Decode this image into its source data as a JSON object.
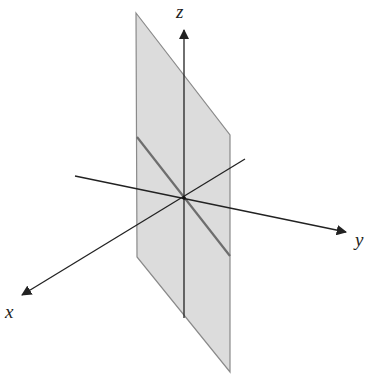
{
  "diagram": {
    "type": "3d-coordinate-axes-with-plane",
    "axes": {
      "x": {
        "label": "x",
        "from": [
          245,
          159
        ],
        "to": [
          22,
          295
        ]
      },
      "y": {
        "label": "y",
        "from": [
          75,
          176
        ],
        "to": [
          346,
          232
        ]
      },
      "z": {
        "label": "z",
        "from": [
          184,
          318
        ],
        "to": [
          184,
          30
        ]
      }
    },
    "origin": [
      184,
      198
    ],
    "plane": {
      "points": [
        [
          136,
          13
        ],
        [
          230,
          135
        ],
        [
          230,
          372
        ],
        [
          137,
          257
        ]
      ],
      "fill": "#dcdcdc",
      "stroke": "#8a8a8a"
    },
    "intersection_line": {
      "from": [
        137,
        137
      ],
      "to": [
        230,
        256
      ],
      "color": "#6e6e6e"
    },
    "colors": {
      "axis": "#222222"
    }
  },
  "labels": {
    "x": "x",
    "y": "y",
    "z": "z"
  }
}
